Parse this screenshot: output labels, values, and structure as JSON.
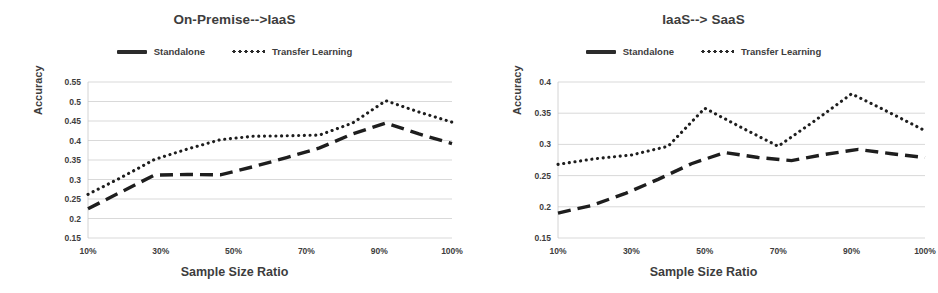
{
  "figure": {
    "panels": [
      {
        "title": "On-Premise-->IaaS",
        "legend": [
          {
            "label": "Standalone",
            "style": "dashed",
            "icon": "dashed-line-icon"
          },
          {
            "label": "Transfer Learning",
            "style": "dotted",
            "icon": "dotted-line-icon"
          }
        ],
        "xlabel": "Sample Size Ratio",
        "ylabel": "Accuracy",
        "yticks": [
          "0.55",
          "0.5",
          "0.45",
          "0.4",
          "0.35",
          "0.3",
          "0.25",
          "0.2",
          "0.15"
        ],
        "xticks": [
          "10%",
          "",
          "30%",
          "",
          "50%",
          "",
          "70%",
          "",
          "90%",
          "",
          "100%"
        ]
      },
      {
        "title": "IaaS--> SaaS",
        "legend": [
          {
            "label": "Standalone",
            "style": "dashed",
            "icon": "dashed-line-icon"
          },
          {
            "label": "Transfer Learning",
            "style": "dotted",
            "icon": "dotted-line-icon"
          }
        ],
        "xlabel": "Sample Size Ratio",
        "ylabel": "Accuracy",
        "yticks": [
          "0.4",
          "0.35",
          "0.3",
          "0.25",
          "0.2",
          "0.15"
        ],
        "xticks": [
          "10%",
          "",
          "30%",
          "",
          "50%",
          "",
          "70%",
          "",
          "90%",
          "",
          "100%"
        ]
      }
    ]
  },
  "chart_data": [
    {
      "type": "line",
      "title": "On-Premise-->IaaS",
      "xlabel": "Sample Size Ratio",
      "ylabel": "Accuracy",
      "categories": [
        "10%",
        "20%",
        "30%",
        "40%",
        "50%",
        "60%",
        "70%",
        "80%",
        "90%",
        "95%",
        "100%"
      ],
      "x_tick_labels": [
        "10%",
        "30%",
        "50%",
        "70%",
        "90%",
        "100%"
      ],
      "ylim": [
        0.15,
        0.55
      ],
      "yticks": [
        0.15,
        0.2,
        0.25,
        0.3,
        0.35,
        0.4,
        0.45,
        0.5,
        0.55
      ],
      "grid": true,
      "legend_position": "top-center",
      "series": [
        {
          "name": "Standalone",
          "style": "dashed",
          "values": [
            0.225,
            0.268,
            0.311,
            0.313,
            0.312,
            0.333,
            0.356,
            0.381,
            0.417,
            0.445,
            0.417,
            0.392
          ]
        },
        {
          "name": "Transfer Learning",
          "style": "dotted",
          "values": [
            0.262,
            0.305,
            0.351,
            0.378,
            0.402,
            0.411,
            0.412,
            0.414,
            0.445,
            0.502,
            0.473,
            0.447
          ]
        }
      ]
    },
    {
      "type": "line",
      "title": "IaaS--> SaaS",
      "xlabel": "Sample Size Ratio",
      "ylabel": "Accuracy",
      "categories": [
        "10%",
        "20%",
        "30%",
        "40%",
        "50%",
        "60%",
        "70%",
        "80%",
        "90%",
        "95%",
        "100%"
      ],
      "x_tick_labels": [
        "10%",
        "30%",
        "50%",
        "70%",
        "90%",
        "100%"
      ],
      "ylim": [
        0.15,
        0.4
      ],
      "yticks": [
        0.15,
        0.2,
        0.25,
        0.3,
        0.35,
        0.4
      ],
      "grid": true,
      "legend_position": "top-center",
      "series": [
        {
          "name": "Standalone",
          "style": "dashed",
          "values": [
            0.19,
            0.202,
            0.221,
            0.244,
            0.269,
            0.287,
            0.279,
            0.274,
            0.284,
            0.292,
            0.285,
            0.279
          ]
        },
        {
          "name": "Transfer Learning",
          "style": "dotted",
          "values": [
            0.268,
            0.277,
            0.283,
            0.297,
            0.358,
            0.327,
            0.297,
            0.338,
            0.381,
            0.352,
            0.322
          ]
        }
      ]
    }
  ],
  "colors": {
    "line": "#1e1e1e",
    "grid": "#c9c9c9",
    "text": "#3d3d3d",
    "background": "#ffffff"
  }
}
